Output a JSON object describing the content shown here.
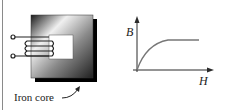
{
  "figure": {
    "core_label": "Iron core",
    "graph": {
      "y_axis_label": "B",
      "x_axis_label": "H",
      "curve": "saturation"
    }
  },
  "colors": {
    "line": "#2a2a2a",
    "core_dark": "#111111",
    "core_light": "#e6e6e6"
  }
}
